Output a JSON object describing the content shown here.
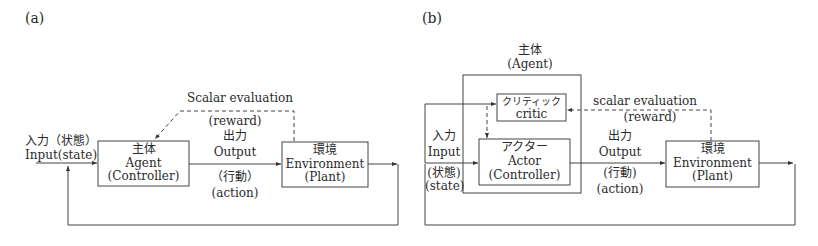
{
  "panel_a": {
    "label": "(a)",
    "input": {
      "ja": "入力（状態）",
      "en": "Input(state)"
    },
    "agent": {
      "ja": "主体",
      "en": "Agent",
      "sub": "(Controller)"
    },
    "evaluation": {
      "title": "Scalar evaluation",
      "sub": "(reward)"
    },
    "output": {
      "ja": "出力",
      "en": "Output",
      "ja_sub": "（行動）",
      "en_sub": "(action)"
    },
    "environment": {
      "ja": "環境",
      "en": "Environment",
      "sub": "(Plant)"
    }
  },
  "panel_b": {
    "label": "(b)",
    "agent_group": {
      "ja": "主体",
      "en": "(Agent)"
    },
    "critic": {
      "ja": "クリティック",
      "en": "critic"
    },
    "actor": {
      "ja": "アクター",
      "en": "Actor",
      "sub": "(Controller)"
    },
    "input": {
      "ja": "入力",
      "en": "Input",
      "ja_sub": "(状態)",
      "en_sub": "(state)"
    },
    "evaluation": {
      "title": "scalar evaluation",
      "sub": "(reward)"
    },
    "output": {
      "ja": "出力",
      "en": "Output",
      "ja_sub": "(行動)",
      "en_sub": "(action)"
    },
    "environment": {
      "ja": "環境",
      "en": "Environment",
      "sub": "(Plant)"
    }
  }
}
